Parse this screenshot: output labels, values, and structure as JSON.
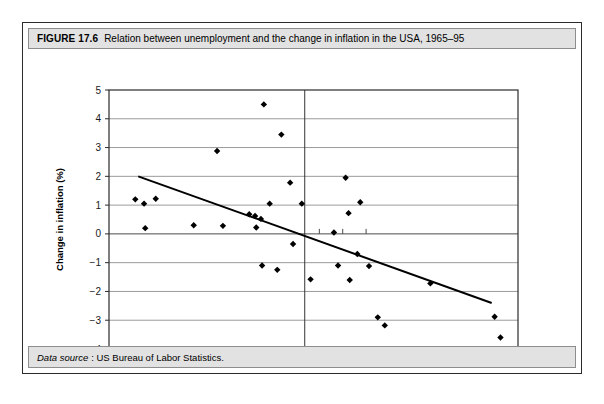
{
  "figure": {
    "number": "FIGURE 17.6",
    "title": "Relation between unemployment and the change in inflation in the USA, 1965–95",
    "source_label": "Data source",
    "source_text": ": US Bureau of Labor Statistics."
  },
  "chart_data": {
    "type": "scatter",
    "title": "Relation between unemployment and the change in inflation in the USA, 1965–95",
    "xlabel": "Unemployment rate (%)",
    "ylabel": "Change in inflation (%)",
    "xlim": [
      3,
      10
    ],
    "ylim": [
      -4,
      5
    ],
    "xticks": [
      "3",
      "4",
      "5",
      "6",
      "7",
      "8",
      "9",
      "10"
    ],
    "xtick_values": [
      3,
      4,
      5,
      6,
      7,
      8,
      9,
      10
    ],
    "yticks": [
      "5",
      "4",
      "3",
      "2",
      "1",
      "0",
      "−1",
      "−2",
      "−3",
      "−4"
    ],
    "ytick_values": [
      5,
      4,
      3,
      2,
      1,
      0,
      -1,
      -2,
      -3,
      -4
    ],
    "grid": "horizontal",
    "legend": "none",
    "marker": "diamond",
    "marker_color": "#000000",
    "points": [
      {
        "x": 3.45,
        "y": 1.2
      },
      {
        "x": 3.6,
        "y": 1.05
      },
      {
        "x": 3.62,
        "y": 0.2
      },
      {
        "x": 3.8,
        "y": 1.22
      },
      {
        "x": 4.45,
        "y": 0.3
      },
      {
        "x": 4.85,
        "y": 2.88
      },
      {
        "x": 4.95,
        "y": 0.28
      },
      {
        "x": 5.4,
        "y": 0.68
      },
      {
        "x": 5.5,
        "y": 0.62
      },
      {
        "x": 5.52,
        "y": 0.22
      },
      {
        "x": 5.6,
        "y": 0.52
      },
      {
        "x": 5.62,
        "y": -1.1
      },
      {
        "x": 5.65,
        "y": 4.5
      },
      {
        "x": 5.75,
        "y": 1.05
      },
      {
        "x": 5.88,
        "y": -1.25
      },
      {
        "x": 5.95,
        "y": 3.45
      },
      {
        "x": 6.1,
        "y": 1.78
      },
      {
        "x": 6.15,
        "y": -0.35
      },
      {
        "x": 6.3,
        "y": 1.05
      },
      {
        "x": 6.45,
        "y": -1.58
      },
      {
        "x": 6.85,
        "y": 0.05
      },
      {
        "x": 6.92,
        "y": -1.1
      },
      {
        "x": 7.05,
        "y": 1.95
      },
      {
        "x": 7.1,
        "y": 0.72
      },
      {
        "x": 7.12,
        "y": -1.6
      },
      {
        "x": 7.25,
        "y": -0.7
      },
      {
        "x": 7.3,
        "y": 1.1
      },
      {
        "x": 7.45,
        "y": -1.12
      },
      {
        "x": 7.6,
        "y": -2.9
      },
      {
        "x": 7.72,
        "y": -3.18
      },
      {
        "x": 8.5,
        "y": -1.72
      },
      {
        "x": 9.6,
        "y": -2.88
      },
      {
        "x": 9.7,
        "y": -3.6
      }
    ],
    "trend_line": {
      "x1": 3.5,
      "y1": 2.0,
      "x2": 9.55,
      "y2": -2.4,
      "color": "#000000"
    },
    "vertical_reference_line": {
      "x": 6.35,
      "color": "#333333"
    }
  }
}
